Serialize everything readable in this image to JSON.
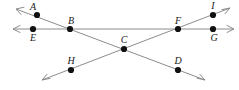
{
  "diagram": {
    "width": 239,
    "height": 90,
    "background_color": "#ffffff",
    "line_color": "#8c8c8c",
    "point_color": "#111111",
    "label_color": "#1a1a1a",
    "labels": {
      "A": "A",
      "B": "B",
      "C": "C",
      "D": "D",
      "E": "E",
      "F": "F",
      "G": "G",
      "H": "H",
      "I": "I"
    },
    "points": [
      {
        "id": "A",
        "label": "A",
        "x": 37,
        "y": 15,
        "label_x": 33,
        "label_y": 10
      },
      {
        "id": "B",
        "label": "B",
        "x": 70,
        "y": 29,
        "label_x": 71,
        "label_y": 24
      },
      {
        "id": "C",
        "label": "C",
        "x": 124,
        "y": 49,
        "label_x": 124,
        "label_y": 43
      },
      {
        "id": "D",
        "label": "D",
        "x": 178,
        "y": 70,
        "label_x": 178,
        "label_y": 64
      },
      {
        "id": "E",
        "label": "E",
        "x": 33,
        "y": 29,
        "label_x": 33,
        "label_y": 41
      },
      {
        "id": "F",
        "label": "F",
        "x": 178,
        "y": 29,
        "label_x": 178,
        "label_y": 24
      },
      {
        "id": "G",
        "label": "G",
        "x": 213,
        "y": 29,
        "label_x": 214,
        "label_y": 41
      },
      {
        "id": "H",
        "label": "H",
        "x": 71,
        "y": 70,
        "label_x": 71,
        "label_y": 64
      },
      {
        "id": "I",
        "label": "I",
        "x": 213,
        "y": 15,
        "label_x": 213,
        "label_y": 9
      }
    ],
    "lines": [
      {
        "id": "horizontal-line",
        "name": "line-E-B-F-G",
        "through_points": [
          "E",
          "B",
          "F",
          "G"
        ],
        "x1": 13,
        "y1": 29,
        "x2": 234,
        "y2": 29,
        "arrow_start": true,
        "arrow_end": true
      },
      {
        "id": "descending-line",
        "name": "line-A-B-C-D",
        "through_points": [
          "A",
          "B",
          "C",
          "D"
        ],
        "x1": 16,
        "y1": 9,
        "x2": 205,
        "y2": 80,
        "arrow_start": true,
        "arrow_end": true
      },
      {
        "id": "ascending-line",
        "name": "line-H-C-F-I",
        "through_points": [
          "H",
          "C",
          "F",
          "I"
        ],
        "x1": 42,
        "y1": 80,
        "x2": 230,
        "y2": 8,
        "arrow_start": true,
        "arrow_end": true
      }
    ]
  }
}
